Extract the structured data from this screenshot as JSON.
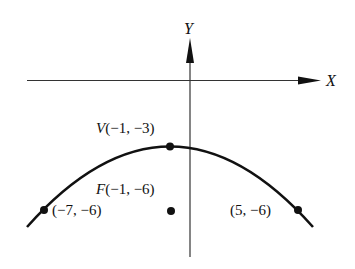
{
  "diagram": {
    "type": "parabola",
    "axes": {
      "x_label": "X",
      "y_label": "Y"
    },
    "vertex": {
      "label_prefix": "V",
      "coords": "(−1, −3)",
      "x": -1,
      "y": -3
    },
    "focus": {
      "label_prefix": "F",
      "coords": "(−1, −6)",
      "x": -1,
      "y": -6
    },
    "points": [
      {
        "label": "(−7, −6)",
        "x": -7,
        "y": -6
      },
      {
        "label": "(5, −6)",
        "x": 5,
        "y": -6
      }
    ],
    "colors": {
      "ink": "#111111",
      "background": "#ffffff"
    }
  }
}
